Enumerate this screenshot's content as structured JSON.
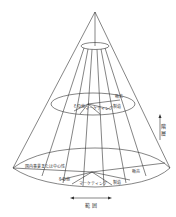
{
  "diagram": {
    "type": "cone",
    "levels": [
      {
        "name": "apex-ellipse",
        "labels": []
      },
      {
        "name": "middle-ellipse",
        "labels": {
          "other": "その他",
          "marketing": "マーケティング",
          "sales": "販売",
          "manufacturing": "製造"
        }
      },
      {
        "name": "base-ellipse",
        "labels": {
          "core": "国内事業または中心性",
          "other": "その他",
          "marketing": "マーケティング",
          "manufacturing": "製造",
          "sales": "販売"
        }
      }
    ],
    "axes": {
      "vertical": "階 層",
      "horizontal": "範 囲"
    },
    "colors": {
      "line": "#333333",
      "background": "#ffffff"
    }
  }
}
